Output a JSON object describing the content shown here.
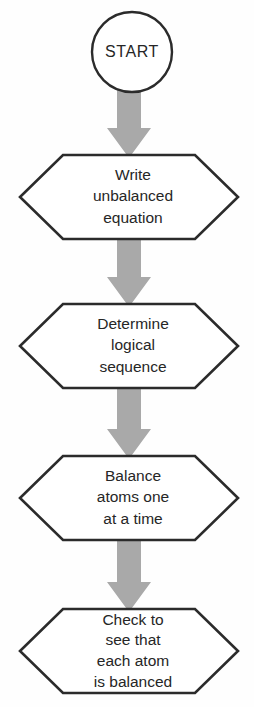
{
  "diagram": {
    "background_color": "#fefefe",
    "node_fill": "#ffffff",
    "node_stroke": "#2b2b2b",
    "arrow_color": "#a9a9a9",
    "text_color": "#262626"
  },
  "nodes": [
    {
      "id": "start",
      "shape": "circle",
      "label": "START",
      "lines": [
        "START"
      ],
      "cx": 132,
      "cy": 52,
      "r": 40
    },
    {
      "id": "step-1",
      "shape": "hexagon",
      "label": "Write unbalanced equation",
      "lines": [
        "Write",
        "unbalanced",
        "equation"
      ],
      "top": 154,
      "bottom": 240,
      "left": 20,
      "right": 238,
      "text_center_x": 133
    },
    {
      "id": "step-2",
      "shape": "hexagon",
      "label": "Determine logical sequence",
      "lines": [
        "Determine",
        "logical",
        "sequence"
      ],
      "top": 303,
      "bottom": 389,
      "left": 20,
      "right": 238,
      "text_center_x": 133
    },
    {
      "id": "step-3",
      "shape": "hexagon",
      "label": "Balance atoms one at a time",
      "lines": [
        "Balance",
        "atoms one",
        "at a time"
      ],
      "top": 455,
      "bottom": 541,
      "left": 20,
      "right": 238,
      "text_center_x": 133
    },
    {
      "id": "step-4",
      "shape": "hexagon",
      "label": "Check to see that each atom is balanced",
      "lines": [
        "Check to",
        "see that",
        "each atom",
        "is balanced"
      ],
      "top": 608,
      "bottom": 694,
      "left": 20,
      "right": 238,
      "text_center_x": 133
    }
  ],
  "connectors": [
    {
      "id": "arrow-start-to-step1",
      "from": "start",
      "to": "step-1",
      "direction": "down",
      "top": 90,
      "bottom": 158,
      "center_x": 129
    },
    {
      "id": "arrow-step1-to-step2",
      "from": "step-1",
      "to": "step-2",
      "direction": "down",
      "top": 240,
      "bottom": 307,
      "center_x": 129
    },
    {
      "id": "arrow-step2-to-step3",
      "from": "step-2",
      "to": "step-3",
      "direction": "down",
      "top": 389,
      "bottom": 459,
      "center_x": 129
    },
    {
      "id": "arrow-step3-to-step4",
      "from": "step-3",
      "to": "step-4",
      "direction": "down",
      "top": 541,
      "bottom": 612,
      "center_x": 129
    }
  ]
}
